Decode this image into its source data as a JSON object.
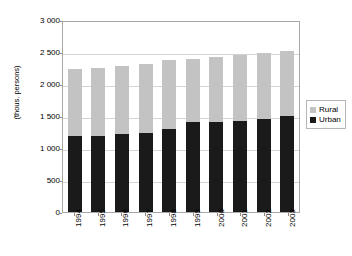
{
  "chart_data": {
    "type": "bar",
    "subtype": "stacked-vertical",
    "title": "",
    "xlabel": "",
    "ylabel": "(thous. persons)",
    "ylim": [
      0,
      3000
    ],
    "ytick_step": 500,
    "ytick_labels": [
      "3 000",
      "2 500",
      "2 000",
      "1 500",
      "1 000",
      "500",
      "0"
    ],
    "ytick_values": [
      3000,
      2500,
      2000,
      1500,
      1000,
      500,
      0
    ],
    "grid": true,
    "grid_axis": "y",
    "legend_position": "right",
    "categories": [
      "1994",
      "1995",
      "1996",
      "1997",
      "1998",
      "1999",
      "2000",
      "2001",
      "2002",
      "2003"
    ],
    "series": [
      {
        "name": "Urban",
        "color": "#1a1a1a",
        "values": [
          1180,
          1190,
          1215,
          1240,
          1290,
          1400,
          1410,
          1420,
          1450,
          1500
        ]
      },
      {
        "name": "Rural",
        "color": "#c3c3c3",
        "values": [
          1050,
          1065,
          1065,
          1080,
          1090,
          990,
          1010,
          1035,
          1035,
          1020
        ]
      }
    ],
    "totals": [
      2230,
      2255,
      2280,
      2320,
      2380,
      2390,
      2420,
      2455,
      2485,
      2520
    ]
  },
  "legend": {
    "items": [
      {
        "label": "Rural",
        "color": "#c3c3c3",
        "swatch": "square-gray"
      },
      {
        "label": "Urban",
        "color": "#1a1a1a",
        "swatch": "square-black"
      }
    ]
  }
}
